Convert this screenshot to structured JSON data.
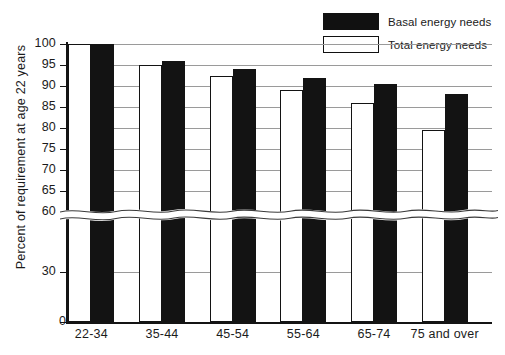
{
  "legend": {
    "items": [
      {
        "label": "Basal energy needs",
        "swatch": "filled",
        "color": "#131313"
      },
      {
        "label": "Total energy needs",
        "swatch": "open",
        "color": "#ffffff"
      }
    ]
  },
  "axis": {
    "y_title": "Percent of requirement at age 22 years",
    "zero_label": "0"
  },
  "caption": "",
  "chart_data": {
    "type": "bar",
    "title": "",
    "xlabel": "",
    "ylabel": "Percent of requirement at age 22 years",
    "categories": [
      "22-34",
      "35-44",
      "45-54",
      "55-64",
      "65-74",
      "75 and over"
    ],
    "series": [
      {
        "name": "Total energy needs",
        "values": [
          100,
          95,
          92.5,
          89,
          86,
          79.5
        ]
      },
      {
        "name": "Basal energy needs",
        "values": [
          100,
          96,
          94,
          92,
          90.5,
          88
        ]
      }
    ],
    "ylim": [
      0,
      100
    ],
    "yticks": [
      0,
      30,
      60,
      65,
      70,
      75,
      80,
      85,
      90,
      95,
      100
    ],
    "ytick_labels": [
      "0",
      "30",
      "60",
      "65",
      "70",
      "75",
      "80",
      "85",
      "90",
      "95",
      "100"
    ],
    "axis_break": {
      "between": [
        30,
        60
      ],
      "style": "wavy"
    },
    "grid": true,
    "legend_position": "top-right",
    "bar_colors": {
      "total": "#ffffff",
      "basal": "#131313"
    },
    "bar_outline": "#131313"
  }
}
